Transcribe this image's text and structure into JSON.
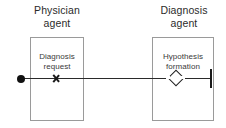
{
  "diagram": {
    "type": "agent-interaction-sequence",
    "lanes": [
      {
        "id": "physician",
        "title": "Physician\nagent",
        "step_label": "Diagnosis\nrequest",
        "marker": "x-marker"
      },
      {
        "id": "diagnosis",
        "title": "Diagnosis\nagent",
        "step_label": "Hypothesis\nformation",
        "marker": "diamond-decision"
      }
    ],
    "flow": {
      "start_node": "filled-circle",
      "end_node": "bar-terminator",
      "line_color": "#2a2a2a"
    },
    "colors": {
      "box_border": "#9a9a9a",
      "text": "#2b2b2b",
      "stroke": "#1a1a1a",
      "background": "#ffffff"
    }
  }
}
